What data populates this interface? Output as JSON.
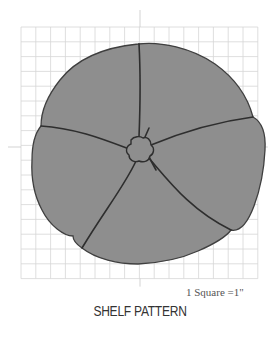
{
  "diagram": {
    "title": "SHELF PATTERN",
    "scale_label": "1 Square =1\"",
    "grid": {
      "x0": 21,
      "y0": 27,
      "cols": 16,
      "rows": 17,
      "cell": 14.8,
      "line_color": "#d6d6d6"
    },
    "center_marks": {
      "x": 140,
      "y": 147,
      "color": "#c8c8c8"
    },
    "shape": {
      "fill": "#8e8e8e",
      "stroke": "#3f3f3f",
      "seam_color": "#2e2e2e",
      "segments": 5,
      "outline_path": "M138,44 C160,41 192,48 215,64 C236,79 248,98 253,117 C262,122 266,133 265,150 C264,170 260,190 254,206 C248,222 240,232 231,230 C226,237 214,244 198,251 C178,260 158,263 138,264 C118,264 96,259 82,248 C76,244 73,240 73,236 C64,236 50,226 42,210 C34,195 31,178 32,160 C32,144 36,132 41,126 C41,112 48,95 60,80 C74,62 98,48 138,44 Z",
      "hub_path": "M131,140 C134,136 140,136 143,138 C147,136 151,140 151,145 C155,148 154,154 150,156 C149,161 144,163 139,161 C134,163 129,160 129,155 C125,152 126,146 131,144 Z",
      "seam_paths": [
        "M139,137 C140,112 141,80 139,44",
        "M151,145 C180,133 215,122 253,117",
        "M148,157 C168,180 190,210 231,230",
        "M136,161 C125,185 105,210 82,248",
        "M129,149 C105,140 75,128 41,126"
      ],
      "tick_paths": [
        "M145,137 L149,128",
        "M149,157 L156,170"
      ]
    }
  }
}
